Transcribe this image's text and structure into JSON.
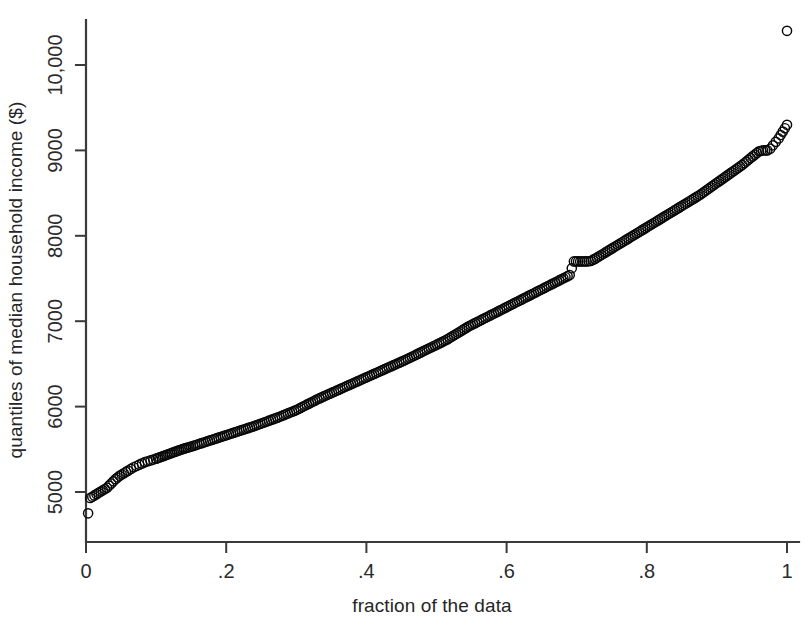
{
  "figure": {
    "background_color": "#ffffff",
    "ink_color": "#111111"
  },
  "chart_data": {
    "type": "scatter",
    "title": "",
    "subtitle": "",
    "xlabel": "fraction of the data",
    "ylabel": "quantiles of median household income ($)",
    "xlim": [
      0,
      1
    ],
    "ylim": [
      4600,
      10600
    ],
    "grid": false,
    "legend": null,
    "legend_position": "none",
    "marker": "open-circle",
    "marker_size_px": 4.6,
    "xticks": [
      0,
      0.2,
      0.4,
      0.6,
      0.8,
      1
    ],
    "xtick_labels": [
      "0",
      ".2",
      ".4",
      ".6",
      ".8",
      "1"
    ],
    "yticks": [
      5000,
      6000,
      7000,
      8000,
      9000,
      10000
    ],
    "ytick_labels": [
      "5000",
      "6000",
      "7000",
      "8000",
      "9000",
      "10,000"
    ],
    "annotations": [
      "isolated low outlier near fraction 0.003 at about 4750",
      "plateau near fraction 0.55 at about 7700",
      "isolated high outlier at fraction 1.00 at about 10400"
    ],
    "series": [
      {
        "name": "quantiles of median household income",
        "x": [
          0.003,
          0.006,
          0.009,
          0.012,
          0.015,
          0.018,
          0.021,
          0.024,
          0.027,
          0.03,
          0.033,
          0.036,
          0.039,
          0.042,
          0.045,
          0.048,
          0.051,
          0.054,
          0.057,
          0.06,
          0.064,
          0.068,
          0.072,
          0.076,
          0.08,
          0.084,
          0.088,
          0.092,
          0.096,
          0.1,
          0.105,
          0.11,
          0.115,
          0.12,
          0.125,
          0.13,
          0.135,
          0.14,
          0.145,
          0.15,
          0.156,
          0.162,
          0.168,
          0.174,
          0.18,
          0.186,
          0.192,
          0.198,
          0.204,
          0.21,
          0.216,
          0.222,
          0.228,
          0.234,
          0.24,
          0.246,
          0.252,
          0.258,
          0.264,
          0.27,
          0.276,
          0.282,
          0.288,
          0.294,
          0.3,
          0.306,
          0.312,
          0.318,
          0.324,
          0.33,
          0.336,
          0.342,
          0.348,
          0.354,
          0.36,
          0.366,
          0.372,
          0.378,
          0.384,
          0.39,
          0.396,
          0.402,
          0.408,
          0.414,
          0.42,
          0.426,
          0.432,
          0.438,
          0.444,
          0.45,
          0.456,
          0.462,
          0.468,
          0.474,
          0.48,
          0.486,
          0.492,
          0.498,
          0.504,
          0.51,
          0.516,
          0.522,
          0.528,
          0.534,
          0.54,
          0.546,
          0.552,
          0.558,
          0.564,
          0.57,
          0.576,
          0.582,
          0.588,
          0.594,
          0.6,
          0.606,
          0.612,
          0.618,
          0.624,
          0.63,
          0.636,
          0.642,
          0.648,
          0.654,
          0.66,
          0.666,
          0.672,
          0.678,
          0.684,
          0.69,
          0.696,
          0.702,
          0.708,
          0.714,
          0.72,
          0.726,
          0.732,
          0.738,
          0.744,
          0.75,
          0.756,
          0.762,
          0.768,
          0.774,
          0.78,
          0.786,
          0.792,
          0.798,
          0.804,
          0.81,
          0.816,
          0.822,
          0.828,
          0.834,
          0.84,
          0.846,
          0.852,
          0.858,
          0.864,
          0.87,
          0.876,
          0.882,
          0.888,
          0.894,
          0.9,
          0.906,
          0.912,
          0.918,
          0.924,
          0.93,
          0.936,
          0.942,
          0.948,
          0.954,
          0.96,
          0.966,
          0.972,
          0.976,
          0.98,
          0.984,
          0.988,
          0.991,
          0.994,
          0.997,
          1.0
        ],
        "y": [
          4750,
          4930,
          4945,
          4960,
          4975,
          4990,
          5005,
          5020,
          5035,
          5050,
          5075,
          5100,
          5125,
          5150,
          5170,
          5190,
          5205,
          5220,
          5235,
          5250,
          5270,
          5290,
          5305,
          5320,
          5335,
          5350,
          5360,
          5370,
          5380,
          5390,
          5405,
          5420,
          5435,
          5450,
          5465,
          5480,
          5495,
          5508,
          5520,
          5532,
          5548,
          5565,
          5580,
          5596,
          5612,
          5628,
          5644,
          5660,
          5676,
          5692,
          5708,
          5724,
          5740,
          5756,
          5772,
          5790,
          5808,
          5826,
          5844,
          5862,
          5880,
          5900,
          5920,
          5940,
          5960,
          5985,
          6010,
          6035,
          6060,
          6085,
          6108,
          6130,
          6152,
          6174,
          6196,
          6218,
          6240,
          6262,
          6284,
          6306,
          6328,
          6350,
          6372,
          6394,
          6416,
          6438,
          6460,
          6482,
          6504,
          6526,
          6548,
          6572,
          6596,
          6620,
          6644,
          6668,
          6692,
          6716,
          6740,
          6764,
          6790,
          6820,
          6850,
          6880,
          6910,
          6940,
          6965,
          6990,
          7015,
          7040,
          7065,
          7090,
          7115,
          7140,
          7165,
          7190,
          7215,
          7240,
          7265,
          7290,
          7315,
          7340,
          7365,
          7390,
          7415,
          7440,
          7465,
          7490,
          7515,
          7540,
          7700,
          7700,
          7700,
          7700,
          7705,
          7730,
          7760,
          7790,
          7820,
          7850,
          7880,
          7910,
          7940,
          7970,
          8000,
          8030,
          8060,
          8090,
          8120,
          8150,
          8180,
          8210,
          8240,
          8270,
          8300,
          8330,
          8360,
          8390,
          8420,
          8450,
          8480,
          8515,
          8550,
          8585,
          8620,
          8655,
          8690,
          8725,
          8760,
          8795,
          8830,
          8870,
          8910,
          8950,
          8990,
          9000,
          9000,
          9020,
          9060,
          9100,
          9140,
          9180,
          9220,
          9260,
          9300
        ]
      }
    ],
    "geometry": {
      "plot_left_px": 86,
      "plot_right_px": 787,
      "y5000_px": 492,
      "y10000_px": 65
    }
  }
}
